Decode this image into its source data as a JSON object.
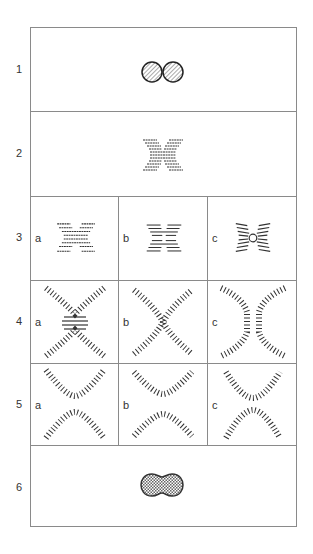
{
  "diagram": {
    "rows": [
      {
        "label": "1",
        "description": "two separate hatched circles (vesicles) in contact"
      },
      {
        "label": "2",
        "description": "stalk/bilayer contact with lipid lamellae forming an X"
      },
      {
        "label": "3",
        "description": "three sub-stages of contact",
        "subs": [
          {
            "label": "a"
          },
          {
            "label": "b"
          },
          {
            "label": "c"
          }
        ]
      },
      {
        "label": "4",
        "description": "bilayer bending into X-shaped stalk",
        "subs": [
          {
            "label": "a"
          },
          {
            "label": "b"
          },
          {
            "label": "c"
          }
        ]
      },
      {
        "label": "5",
        "description": "separation into two curved bilayers",
        "subs": [
          {
            "label": "a"
          },
          {
            "label": "b"
          },
          {
            "label": "c"
          }
        ]
      },
      {
        "label": "6",
        "description": "fused crosshatched peanut-shaped vesicle"
      }
    ],
    "colors": {
      "border": "#8a8a8a",
      "ink": "#333333",
      "fill_hatch": "#666666"
    }
  }
}
